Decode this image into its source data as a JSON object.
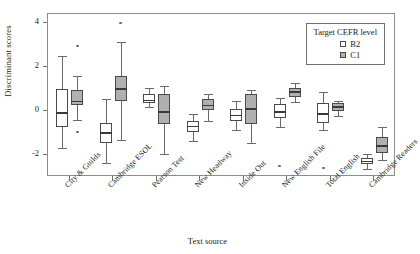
{
  "chart_data": {
    "type": "box",
    "title": "",
    "xlabel": "Text source",
    "ylabel": "Discriminant scores",
    "ylim": [
      -3.0,
      4.4
    ],
    "yticks": [
      -2,
      0,
      2,
      4
    ],
    "ytick_labels": [
      "-2",
      "0",
      "2",
      "4"
    ],
    "grid": false,
    "legend": {
      "title": "Target CEFR level",
      "position": "top-right",
      "entries": [
        {
          "label": "B2",
          "color": "#ffffff"
        },
        {
          "label": "C1",
          "color": "#b0b0b0"
        }
      ]
    },
    "categories": [
      "City & Guilds",
      "Cambridge ESOL",
      "Pearson Test",
      "New Headway",
      "Inside Out",
      "New English File",
      "Total English",
      "Cambridge Readers"
    ],
    "series": [
      {
        "name": "B2",
        "color": "#ffffff",
        "boxes": [
          {
            "category": "City & Guilds",
            "whisker_low": -1.7,
            "q1": -0.75,
            "median": -0.1,
            "q3": 1.0,
            "whisker_high": 2.5,
            "outliers": []
          },
          {
            "category": "Cambridge ESOL",
            "whisker_low": -2.35,
            "q1": -1.45,
            "median": -1.0,
            "q3": -0.55,
            "whisker_high": 0.55,
            "outliers": []
          },
          {
            "category": "Pearson Test",
            "whisker_low": 0.2,
            "q1": 0.35,
            "median": 0.48,
            "q3": 0.75,
            "whisker_high": 1.05,
            "outliers": []
          },
          {
            "category": "New Headway",
            "whisker_low": -1.35,
            "q1": -0.95,
            "median": -0.7,
            "q3": -0.45,
            "whisker_high": -0.15,
            "outliers": []
          },
          {
            "category": "Inside Out",
            "whisker_low": -0.85,
            "q1": -0.45,
            "median": -0.2,
            "q3": 0.1,
            "whisker_high": 0.45,
            "outliers": []
          },
          {
            "category": "New English File",
            "whisker_low": -0.75,
            "q1": -0.3,
            "median": -0.05,
            "q3": 0.3,
            "whisker_high": 0.6,
            "outliers": [
              -2.5
            ]
          },
          {
            "category": "Total English",
            "whisker_low": -0.85,
            "q1": -0.55,
            "median": -0.15,
            "q3": 0.35,
            "whisker_high": 0.85,
            "outliers": [
              -2.6
            ]
          },
          {
            "category": "Cambridge Readers",
            "whisker_low": -2.65,
            "q1": -2.4,
            "median": -2.3,
            "q3": -2.15,
            "whisker_high": -1.95,
            "outliers": []
          }
        ]
      },
      {
        "name": "C1",
        "color": "#b0b0b0",
        "boxes": [
          {
            "category": "City & Guilds",
            "whisker_low": -0.4,
            "q1": 0.25,
            "median": 0.42,
            "q3": 0.95,
            "whisker_high": 1.6,
            "outliers": [
              2.95,
              -0.95
            ]
          },
          {
            "category": "Cambridge ESOL",
            "whisker_low": -1.3,
            "q1": 0.45,
            "median": 1.0,
            "q3": 1.6,
            "whisker_high": 3.15,
            "outliers": [
              4.0
            ]
          },
          {
            "category": "Pearson Test",
            "whisker_low": -1.95,
            "q1": -0.6,
            "median": -0.05,
            "q3": 0.78,
            "whisker_high": 1.15,
            "outliers": []
          },
          {
            "category": "New Headway",
            "whisker_low": -0.45,
            "q1": 0.05,
            "median": 0.25,
            "q3": 0.55,
            "whisker_high": 0.75,
            "outliers": []
          },
          {
            "category": "Inside Out",
            "whisker_low": -1.45,
            "q1": -0.6,
            "median": 0.1,
            "q3": 0.75,
            "whisker_high": 0.95,
            "outliers": []
          },
          {
            "category": "New English File",
            "whisker_low": 0.4,
            "q1": 0.65,
            "median": 0.85,
            "q3": 1.05,
            "whisker_high": 1.25,
            "outliers": []
          },
          {
            "category": "Total English",
            "whisker_low": -0.25,
            "q1": 0.0,
            "median": 0.18,
            "q3": 0.35,
            "whisker_high": 0.45,
            "outliers": []
          },
          {
            "category": "Cambridge Readers",
            "whisker_low": -2.25,
            "q1": -1.9,
            "median": -1.6,
            "q3": -1.2,
            "whisker_high": -0.75,
            "outliers": []
          }
        ]
      }
    ]
  }
}
